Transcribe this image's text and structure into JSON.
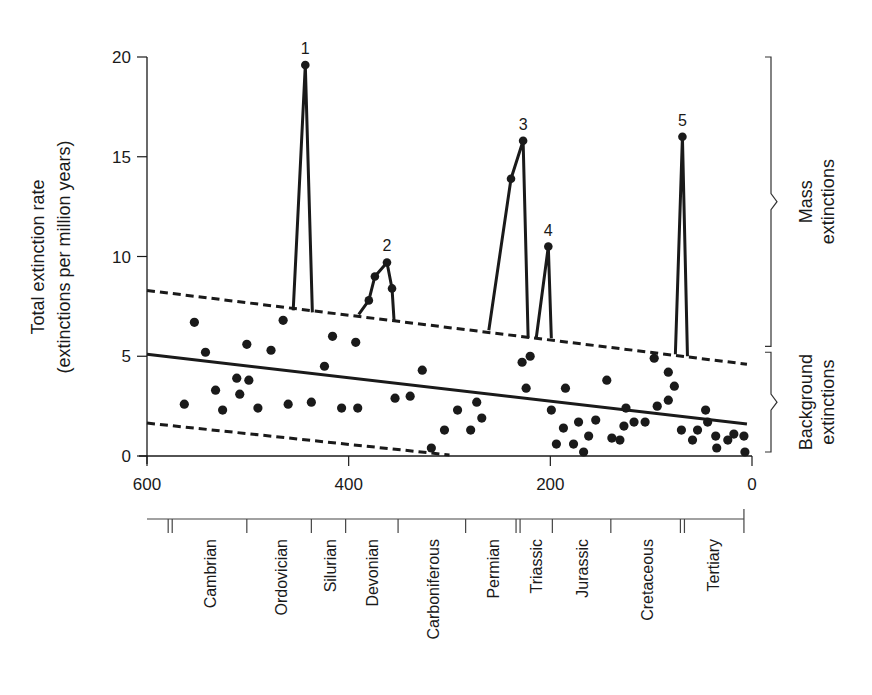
{
  "chart_data": {
    "type": "scatter",
    "title": "",
    "xlabel": "",
    "ylabel": "Total extinction rate",
    "ylabel_line2": "(extinctions per million years)",
    "xlim": [
      600,
      0
    ],
    "ylim": [
      0,
      20
    ],
    "x_ticks": [
      600,
      400,
      200,
      0
    ],
    "y_ticks": [
      0,
      5,
      10,
      15,
      20
    ],
    "grid": false,
    "x_axis_units": "millions of years ago (reversed)",
    "background_points": [
      [
        563,
        2.6
      ],
      [
        553,
        6.7
      ],
      [
        542,
        5.2
      ],
      [
        532,
        3.3
      ],
      [
        525,
        2.3
      ],
      [
        511,
        3.9
      ],
      [
        508,
        3.1
      ],
      [
        501,
        5.6
      ],
      [
        499,
        3.8
      ],
      [
        490,
        2.4
      ],
      [
        477,
        5.3
      ],
      [
        465,
        6.8
      ],
      [
        460,
        2.6
      ],
      [
        437,
        2.7
      ],
      [
        424,
        4.5
      ],
      [
        416,
        6.0
      ],
      [
        407,
        2.4
      ],
      [
        393,
        5.7
      ],
      [
        391,
        2.4
      ],
      [
        354,
        2.9
      ],
      [
        339,
        3.0
      ],
      [
        327,
        4.3
      ],
      [
        318,
        0.4
      ],
      [
        305,
        1.3
      ],
      [
        292,
        2.3
      ],
      [
        279,
        1.3
      ],
      [
        273,
        2.7
      ],
      [
        268,
        1.9
      ],
      [
        228,
        4.7
      ],
      [
        220,
        5.0
      ],
      [
        224,
        3.4
      ],
      [
        199,
        2.3
      ],
      [
        194,
        0.6
      ],
      [
        187,
        1.4
      ],
      [
        185,
        3.4
      ],
      [
        177,
        0.6
      ],
      [
        172,
        1.7
      ],
      [
        167,
        0.2
      ],
      [
        162,
        1.0
      ],
      [
        155,
        1.8
      ],
      [
        144,
        3.8
      ],
      [
        139,
        0.9
      ],
      [
        131,
        0.8
      ],
      [
        127,
        1.5
      ],
      [
        125,
        2.4
      ],
      [
        117,
        1.7
      ],
      [
        106,
        1.7
      ],
      [
        97,
        4.9
      ],
      [
        94,
        2.5
      ],
      [
        83,
        4.2
      ],
      [
        83,
        2.8
      ],
      [
        77,
        3.5
      ],
      [
        70,
        1.3
      ],
      [
        59,
        0.8
      ],
      [
        54,
        1.3
      ],
      [
        46,
        2.3
      ],
      [
        44,
        1.7
      ],
      [
        36,
        1.0
      ],
      [
        35,
        0.4
      ],
      [
        24,
        0.8
      ],
      [
        18,
        1.1
      ],
      [
        8,
        1.0
      ],
      [
        7,
        0.2
      ]
    ],
    "mass_extinction_events": [
      {
        "label": "1",
        "points": [
          [
            455,
            7.3
          ],
          [
            443,
            19.6
          ],
          [
            436,
            7.2
          ]
        ]
      },
      {
        "label": "2",
        "points": [
          [
            390,
            7.1
          ],
          [
            380,
            7.8
          ],
          [
            374,
            9.0
          ],
          [
            362,
            9.7
          ],
          [
            357,
            8.4
          ],
          [
            355,
            6.8
          ]
        ]
      },
      {
        "label": "3",
        "points": [
          [
            261,
            6.3
          ],
          [
            239,
            13.9
          ],
          [
            227,
            15.8
          ],
          [
            222,
            5.9
          ]
        ]
      },
      {
        "label": "4",
        "points": [
          [
            214,
            5.9
          ],
          [
            202,
            10.5
          ],
          [
            199,
            5.9
          ]
        ]
      },
      {
        "label": "5",
        "points": [
          [
            76,
            5.1
          ],
          [
            69,
            16.0
          ],
          [
            64,
            5.0
          ]
        ]
      }
    ],
    "marked_points": [
      [
        443,
        19.6
      ],
      [
        380,
        7.8
      ],
      [
        374,
        9.0
      ],
      [
        362,
        9.7
      ],
      [
        357,
        8.4
      ],
      [
        239,
        13.9
      ],
      [
        227,
        15.8
      ],
      [
        202,
        10.5
      ],
      [
        69,
        16.0
      ]
    ],
    "series": [
      {
        "name": "Regression (mean background rate)",
        "style": "solid",
        "values": [
          [
            600,
            5.1
          ],
          [
            5,
            1.6
          ]
        ]
      },
      {
        "name": "Upper bound",
        "style": "dashed",
        "values": [
          [
            600,
            8.3
          ],
          [
            5,
            4.6
          ]
        ]
      },
      {
        "name": "Lower bound",
        "style": "dashed",
        "values": [
          [
            600,
            1.65
          ],
          [
            300,
            0.05
          ]
        ]
      }
    ],
    "brackets": [
      {
        "label_line1": "Mass",
        "label_line2": "extinctions",
        "y_from": 20,
        "y_to": 5.5
      },
      {
        "label_line1": "Background",
        "label_line2": "extinctions",
        "y_from": 5.2,
        "y_to": 0.2
      }
    ],
    "geologic_periods": [
      {
        "name": "Cambrian",
        "start": 575,
        "end": 500
      },
      {
        "name": "Ordovician",
        "start": 500,
        "end": 435
      },
      {
        "name": "Silurian",
        "start": 435,
        "end": 403
      },
      {
        "name": "Devonian",
        "start": 403,
        "end": 350
      },
      {
        "name": "Carboniferous",
        "start": 350,
        "end": 283
      },
      {
        "name": "Permian",
        "start": 283,
        "end": 231
      },
      {
        "name": "Triassic",
        "start": 231,
        "end": 198
      },
      {
        "name": "Jurassic",
        "start": 198,
        "end": 140
      },
      {
        "name": "Cretaceous",
        "start": 140,
        "end": 69
      },
      {
        "name": "Tertiary",
        "start": 69,
        "end": 8
      }
    ],
    "period_boundaries": [
      579,
      575,
      501,
      437,
      403,
      351,
      284,
      234,
      230,
      198,
      140,
      71,
      67,
      8
    ]
  }
}
